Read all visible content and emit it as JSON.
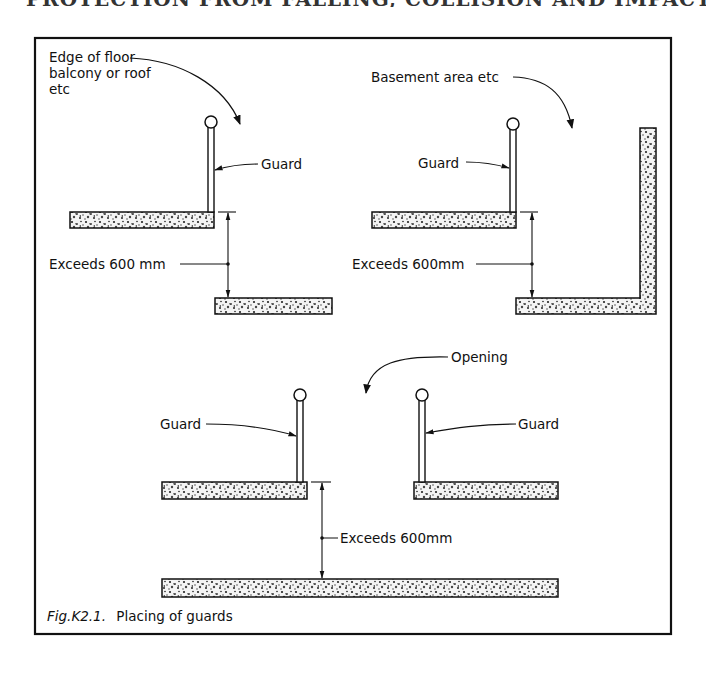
{
  "page_header": "PROTECTION FROM FALLING, COLLISION AND IMPACT",
  "figure": {
    "number": "Fig.K2.1.",
    "caption": "Placing of guards"
  },
  "panels": {
    "top_left": {
      "pointer_label_lines": [
        "Edge of floor",
        "balcony or roof",
        "etc"
      ],
      "guard_label": "Guard",
      "dimension_label": "Exceeds 600 mm"
    },
    "top_right": {
      "pointer_label": "Basement area etc",
      "guard_label": "Guard",
      "dimension_label": "Exceeds 600mm"
    },
    "bottom": {
      "pointer_label": "Opening",
      "guard_left_label": "Guard",
      "guard_right_label": "Guard",
      "dimension_label": "Exceeds 600mm"
    }
  },
  "colors": {
    "ink": "#111111",
    "background": "#ffffff"
  }
}
